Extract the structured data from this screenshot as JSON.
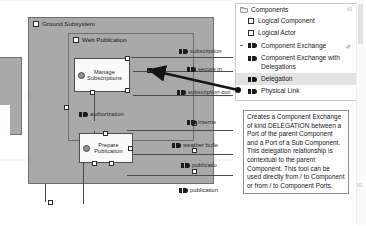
{
  "app": {
    "title": "Capella diagram editor with component palette"
  },
  "diagram": {
    "packages": [
      {
        "label": "Ground Subsystem",
        "icon": "package-icon"
      },
      {
        "label": "Web Publication",
        "icon": "package-icon"
      }
    ],
    "functions": [
      {
        "label_line1": "Manage",
        "label_line2": "Subscriptions",
        "icon": "function-icon"
      },
      {
        "label_line1": "Prepare",
        "label_line2": "Publication",
        "icon": "function-icon"
      }
    ],
    "edge_labels": [
      {
        "text": "subscription",
        "icon": "component-exchange-icon"
      },
      {
        "text": "secure in",
        "icon": "component-exchange-icon"
      },
      {
        "text": "subscription con",
        "icon": "component-exchange-icon"
      },
      {
        "text": "authorization",
        "icon": "component-exchange-icon"
      },
      {
        "text": "interne",
        "icon": "component-exchange-icon"
      },
      {
        "text": "weather bulle",
        "icon": "component-exchange-icon"
      },
      {
        "text": "publicatio",
        "icon": "component-exchange-icon"
      },
      {
        "text": "publication",
        "icon": "component-exchange-icon"
      }
    ]
  },
  "palette": {
    "group": {
      "label": "Components",
      "icon": "folder-icon",
      "badge": "60"
    },
    "items": [
      {
        "label": "Logical Component",
        "icon": "checkbox-icon",
        "kind": "checkbox",
        "selected": false,
        "pin": ""
      },
      {
        "label": "Logical Actor",
        "icon": "checkbox-icon",
        "kind": "checkbox",
        "selected": false,
        "pin": ""
      },
      {
        "label": "Component Exchange",
        "icon": "component-exchange-icon",
        "kind": "exchange",
        "selected": false,
        "pin": "✐"
      },
      {
        "label": "Component Exchange with Delegations",
        "icon": "component-exchange-icon",
        "kind": "exchange",
        "selected": false,
        "pin": ""
      },
      {
        "label": "Delegation",
        "icon": "component-exchange-icon",
        "kind": "exchange",
        "selected": true,
        "pin": ""
      },
      {
        "label": "Physical Link",
        "icon": "component-exchange-icon",
        "kind": "exchange",
        "selected": false,
        "pin": ""
      }
    ],
    "tooltip": {
      "text": "Creates a Component Exchange of kind DELEGATION between a Port of the parent Component and a Port of a Sub Component. This delegation relationship is contextual to the parent Component. This tool can be used directly from / to Component or from / to Component Ports."
    },
    "scroll_badge": "60"
  },
  "colors": {
    "canvas_bg": "#a9a9a9",
    "node_fill": "#fafafa",
    "node_stroke": "#4c4c4c",
    "highlight": "#e2e2e2",
    "arrow": "#1a1a1a",
    "text": "#1a1a1a"
  }
}
